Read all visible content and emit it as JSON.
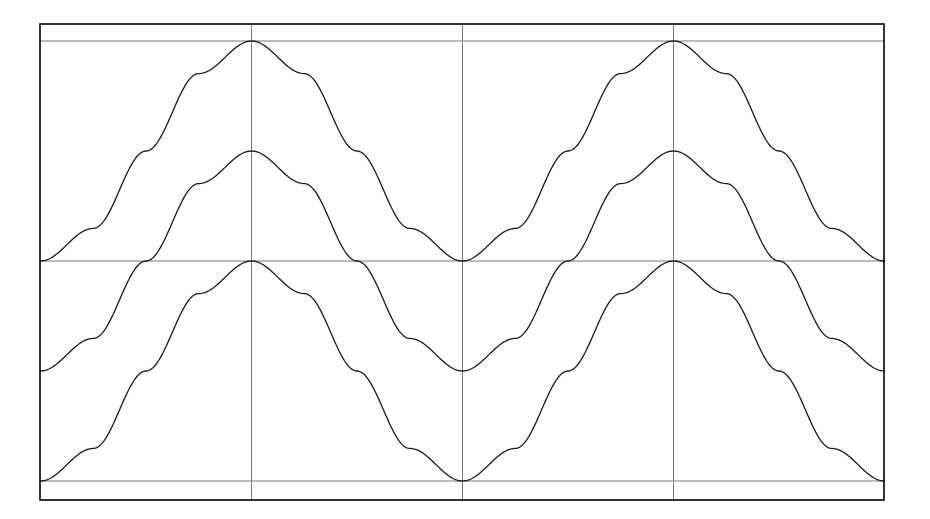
{
  "chart_data": {
    "type": "line",
    "title": "",
    "subtitle": "",
    "xlabel": "",
    "ylabel": "",
    "xlim": [
      0,
      4
    ],
    "ylim": [
      0,
      1
    ],
    "xticks": [
      0,
      1,
      2,
      3,
      4
    ],
    "yticks": [
      0,
      0.5,
      1
    ],
    "xticklabels": [
      "",
      "",
      "",
      "",
      ""
    ],
    "yticklabels": [
      "",
      "",
      ""
    ],
    "grid": true,
    "grid_color": "#808080",
    "frame_color": "#000000",
    "legend": null,
    "legend_position": "none",
    "annotations": [],
    "x": [
      0,
      0.25,
      0.5,
      0.75,
      1,
      1.25,
      1.5,
      1.75,
      2,
      2.25,
      2.5,
      2.75,
      3,
      3.25,
      3.5,
      3.75,
      4
    ],
    "series": [
      {
        "name": "curve-1",
        "color": "#1a1a1a",
        "linewidth": 1.3,
        "description": "raised cosine, baseline 0.5, amplitude 0.5, peak 1.0 at x=2",
        "values": [
          0.5,
          0.574,
          0.75,
          0.926,
          1.0,
          0.926,
          0.75,
          0.574,
          0.5,
          0.574,
          0.75,
          0.926,
          1.0,
          0.926,
          0.75,
          0.574,
          0.5
        ]
      },
      {
        "name": "curve-2",
        "color": "#1a1a1a",
        "linewidth": 1.3,
        "description": "raised cosine, baseline 0.25, amplitude 0.5, peak 0.75 at x=2",
        "values": [
          0.25,
          0.324,
          0.5,
          0.676,
          0.75,
          0.676,
          0.5,
          0.324,
          0.25,
          0.324,
          0.5,
          0.676,
          0.75,
          0.676,
          0.5,
          0.324,
          0.25
        ]
      },
      {
        "name": "curve-3",
        "color": "#1a1a1a",
        "linewidth": 1.3,
        "description": "raised cosine, baseline 0.0, amplitude 0.5, peak 0.5 at x=2",
        "values": [
          0.0,
          0.074,
          0.25,
          0.426,
          0.5,
          0.426,
          0.25,
          0.074,
          0.0,
          0.074,
          0.25,
          0.426,
          0.5,
          0.426,
          0.25,
          0.074,
          0.0
        ]
      }
    ]
  },
  "figure": {
    "background": "#ffffff",
    "plot_background": "#ffffff",
    "border_color": "#000000",
    "gridline_color": "#7a7a7a"
  }
}
